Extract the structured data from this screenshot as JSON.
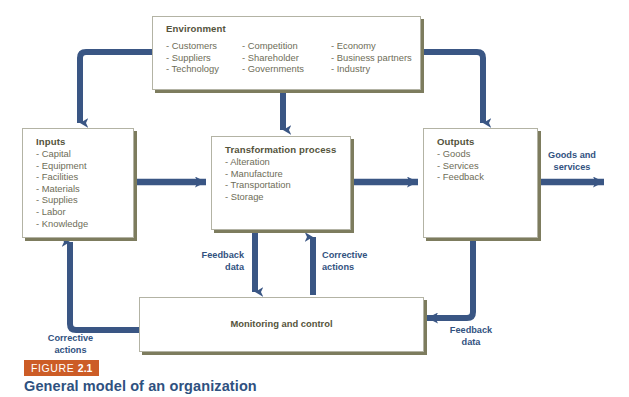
{
  "figure": {
    "badge_prefix": "FIGURE",
    "badge_number": "2.1",
    "title": "General model of an organization",
    "badge_color": "#cc5c26",
    "title_color": "#2f5180"
  },
  "theme": {
    "arrow_color": "#3a5684",
    "box_border": "#b3b3a4",
    "box_shadow": "#7d7c5e",
    "heading_color": "#55543c",
    "item_color": "#6e6d58"
  },
  "boxes": {
    "environment": {
      "title": "Environment",
      "column1": [
        "- Customers",
        "- Suppliers",
        "- Technology"
      ],
      "column2": [
        "- Competition",
        "- Shareholder",
        "- Governments"
      ],
      "column3": [
        "- Economy",
        "- Business partners",
        "- Industry"
      ]
    },
    "inputs": {
      "title": "Inputs",
      "items": [
        "- Capital",
        "- Equipment",
        "- Facilities",
        "- Materials",
        "- Supplies",
        "- Labor",
        "- Knowledge"
      ]
    },
    "transformation": {
      "title": "Transformation process",
      "items": [
        "- Alteration",
        "- Manufacture",
        "- Transportation",
        "- Storage"
      ]
    },
    "outputs": {
      "title": "Outputs",
      "items": [
        "- Goods",
        "- Services",
        "- Feedback"
      ]
    },
    "monitoring": {
      "title": "Monitoring and control"
    }
  },
  "arrow_labels": {
    "goods_and_services": "Goods and\nservices",
    "feedback_data_center": "Feedback\ndata",
    "corrective_actions_center": "Corrective\nactions",
    "corrective_actions_left": "Corrective\nactions",
    "feedback_data_right": "Feedback\ndata"
  }
}
